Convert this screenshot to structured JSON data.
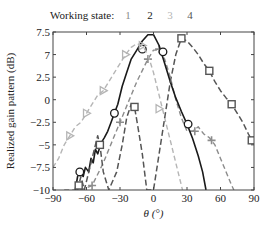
{
  "chart_data": {
    "type": "line",
    "title": "",
    "xlabel": "θ (°)",
    "ylabel": "Realized gain pattern (dB)",
    "xlim": [
      -90,
      90
    ],
    "ylim": [
      -10,
      7.5
    ],
    "xticks": [
      -90,
      -60,
      -30,
      0,
      30,
      60,
      90
    ],
    "xtick_labels": [
      "−90",
      "−60",
      "−30",
      "0",
      "30",
      "60",
      "90"
    ],
    "yticks": [
      7.5,
      5,
      2.5,
      0,
      -2.5,
      -5,
      -7.5,
      -10
    ],
    "ytick_labels": [
      "7.5",
      "7",
      "2.5",
      "0",
      "−2.5",
      "−5",
      "−7.5",
      "−10"
    ],
    "grid": false,
    "legend": {
      "position": "top",
      "title": "Working state:",
      "entries": [
        "1",
        "2",
        "3",
        "4"
      ]
    },
    "series": [
      {
        "name": "1",
        "color": "#8c8c8c",
        "dash": "5,3",
        "width": 1.4,
        "marker": "plus",
        "points": [
          [
            -80,
            -10
          ],
          [
            -65,
            -10
          ],
          [
            -55,
            -9.5
          ],
          [
            -45,
            -7
          ],
          [
            -35,
            -4
          ],
          [
            -25,
            -1
          ],
          [
            -15,
            2
          ],
          [
            -5,
            4.5
          ],
          [
            0,
            5.5
          ],
          [
            5,
            5.5
          ],
          [
            10,
            4.5
          ],
          [
            15,
            2.5
          ],
          [
            20,
            0
          ],
          [
            25,
            -2
          ],
          [
            30,
            -3.5
          ],
          [
            35,
            -3.5
          ],
          [
            40,
            -3
          ],
          [
            45,
            -3.8
          ],
          [
            50,
            -4.2
          ],
          [
            55,
            -5
          ],
          [
            60,
            -6.5
          ],
          [
            65,
            -8
          ],
          [
            70,
            -9.5
          ],
          [
            72,
            -10
          ]
        ],
        "markers": [
          [
            -55,
            -9.5
          ],
          [
            -30,
            -2.5
          ],
          [
            -5,
            4.5
          ],
          [
            5,
            5.6
          ],
          [
            37,
            -3.5
          ],
          [
            52,
            -4.5
          ]
        ]
      },
      {
        "name": "2",
        "color": "#1a1a1a",
        "dash": "",
        "width": 1.6,
        "marker": "circle",
        "points": [
          [
            -70,
            -10
          ],
          [
            -68,
            -8.5
          ],
          [
            -66,
            -8
          ],
          [
            -63,
            -8.5
          ],
          [
            -61,
            -7.5
          ],
          [
            -58,
            -8
          ],
          [
            -56,
            -6.5
          ],
          [
            -54,
            -7
          ],
          [
            -52,
            -5.5
          ],
          [
            -50,
            -6
          ],
          [
            -47,
            -4.8
          ],
          [
            -44,
            -4.2
          ],
          [
            -41,
            -3.5
          ],
          [
            -38,
            -2.5
          ],
          [
            -35,
            -1.5
          ],
          [
            -32,
            -0.5
          ],
          [
            -28,
            1.5
          ],
          [
            -24,
            3
          ],
          [
            -20,
            4.5
          ],
          [
            -15,
            5.5
          ],
          [
            -10,
            6.5
          ],
          [
            -5,
            7.2
          ],
          [
            0,
            7.2
          ],
          [
            5,
            6
          ],
          [
            10,
            4
          ],
          [
            15,
            2
          ],
          [
            20,
            0.2
          ],
          [
            25,
            -1.3
          ],
          [
            30,
            -2.7
          ],
          [
            35,
            -4.3
          ],
          [
            40,
            -6.2
          ],
          [
            44,
            -8
          ],
          [
            47,
            -10
          ]
        ],
        "markers": [
          [
            -66,
            -8
          ],
          [
            -35,
            -1.5
          ],
          [
            -10,
            5.6
          ],
          [
            8.5,
            5.3
          ],
          [
            31,
            -2.7
          ]
        ]
      },
      {
        "name": "3",
        "color": "#b5b5b5",
        "dash": "5,3",
        "width": 1.4,
        "marker": "triangle",
        "points": [
          [
            -90,
            -7.5
          ],
          [
            -85,
            -6.5
          ],
          [
            -80,
            -5
          ],
          [
            -75,
            -4
          ],
          [
            -70,
            -3
          ],
          [
            -65,
            -2.5
          ],
          [
            -60,
            -1.5
          ],
          [
            -55,
            -0.5
          ],
          [
            -50,
            0.5
          ],
          [
            -45,
            1
          ],
          [
            -40,
            2
          ],
          [
            -35,
            3
          ],
          [
            -30,
            4
          ],
          [
            -25,
            5
          ],
          [
            -20,
            5.8
          ],
          [
            -15,
            6.2
          ],
          [
            -10,
            6
          ],
          [
            -5,
            5
          ],
          [
            0,
            3
          ],
          [
            5,
            0.5
          ],
          [
            8,
            -1
          ],
          [
            12,
            -3
          ],
          [
            16,
            -5
          ],
          [
            20,
            -7
          ],
          [
            24,
            -9
          ],
          [
            26,
            -10
          ]
        ],
        "markers": [
          [
            -75,
            -4
          ],
          [
            -60,
            -1.5
          ],
          [
            -45,
            1
          ],
          [
            -25,
            5
          ],
          [
            -10,
            6
          ],
          [
            5,
            -1
          ]
        ]
      },
      {
        "name": "4",
        "color": "#555555",
        "dash": "6,3",
        "width": 1.5,
        "marker": "square",
        "points": [
          [
            -68,
            -10
          ],
          [
            -65,
            -8.5
          ],
          [
            -62,
            -10
          ],
          [
            -55,
            -6.5
          ],
          [
            -50,
            -4
          ],
          [
            -48,
            -5
          ],
          [
            -45,
            -8
          ],
          [
            -40,
            -10
          ],
          [
            -33,
            -8
          ],
          [
            -28,
            -5
          ],
          [
            -24,
            -2
          ],
          [
            -20,
            -0.5
          ],
          [
            -17,
            -0.8
          ],
          [
            -14,
            -3
          ],
          [
            -10,
            -6
          ],
          [
            -6,
            -10
          ],
          [
            0,
            -10
          ],
          [
            5,
            -6
          ],
          [
            10,
            -2
          ],
          [
            15,
            2
          ],
          [
            20,
            5
          ],
          [
            25,
            6.8
          ],
          [
            30,
            6.5
          ],
          [
            35,
            5.8
          ],
          [
            40,
            5
          ],
          [
            45,
            4
          ],
          [
            50,
            3.2
          ],
          [
            55,
            2
          ],
          [
            60,
            1
          ],
          [
            65,
            0.2
          ],
          [
            70,
            -0.5
          ],
          [
            75,
            -1.5
          ],
          [
            80,
            -2.5
          ],
          [
            85,
            -3.8
          ],
          [
            88,
            -4.5
          ],
          [
            90,
            -4.8
          ]
        ],
        "markers": [
          [
            -67,
            -9.5
          ],
          [
            -48,
            -5
          ],
          [
            -17,
            -0.8
          ],
          [
            25,
            6.8
          ],
          [
            50,
            3.2
          ],
          [
            70,
            -0.5
          ],
          [
            88,
            -4.5
          ]
        ]
      }
    ]
  }
}
